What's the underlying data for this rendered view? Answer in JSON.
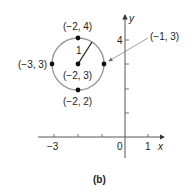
{
  "figure": {
    "caption": "(b)",
    "axes": {
      "x_label": "x",
      "y_label": "y",
      "x_ticks": [
        {
          "value": -3,
          "label": "−3"
        },
        {
          "value": -2,
          "label": ""
        },
        {
          "value": -1,
          "label": ""
        },
        {
          "value": 0,
          "label": "0"
        },
        {
          "value": 1,
          "label": "1"
        }
      ],
      "y_ticks": [
        {
          "value": 1,
          "label": ""
        },
        {
          "value": 2,
          "label": ""
        },
        {
          "value": 3,
          "label": ""
        },
        {
          "value": 4,
          "label": "4"
        }
      ]
    },
    "circle": {
      "center": [
        -2,
        3
      ],
      "radius": 1,
      "radius_label": "1",
      "color": "#9a9a9a"
    },
    "points": [
      {
        "name": "top",
        "coords": [
          -2,
          4
        ],
        "label": "(−2, 4)"
      },
      {
        "name": "left",
        "coords": [
          -3,
          3
        ],
        "label": "(−3, 3)"
      },
      {
        "name": "center",
        "coords": [
          -2,
          3
        ],
        "label": "(−2, 3)"
      },
      {
        "name": "right",
        "coords": [
          -1,
          3
        ],
        "label": "(−1, 3)"
      },
      {
        "name": "bottom",
        "coords": [
          -2,
          2
        ],
        "label": "(−2, 2)"
      }
    ]
  }
}
